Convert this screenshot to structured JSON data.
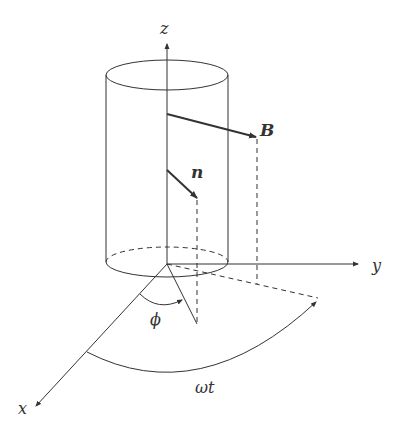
{
  "diagram": {
    "type": "3d-physics-coordinate-diagram",
    "labels": {
      "z_axis": "z",
      "y_axis": "y",
      "x_axis": "x",
      "field": "B",
      "normal": "n",
      "angle_phi": "ϕ",
      "angle_omega_t": "ωt"
    },
    "colors": {
      "line": "#333333",
      "background": "#ffffff"
    }
  }
}
